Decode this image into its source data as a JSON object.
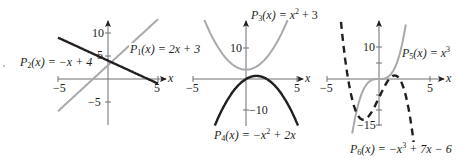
{
  "chart_data": [
    {
      "type": "line",
      "panel": 1,
      "title": "",
      "xlabel": "x",
      "ylabel": "",
      "xlim": [
        -5,
        5.8
      ],
      "ylim": [
        -10,
        13
      ],
      "x_ticks": [
        -5,
        5
      ],
      "x_tick_labels": [
        "-5",
        "5"
      ],
      "y_ticks": [
        -5,
        5,
        10
      ],
      "y_tick_labels": [
        "-5",
        "5",
        "10"
      ],
      "grid": false,
      "series": [
        {
          "name": "P1(x) = 2x + 3",
          "label_text": "P₁(x) = 2x + 3",
          "expr": "2x+3",
          "color": "#a7a9ac",
          "style": "solid",
          "x": [
            -5,
            -4,
            -3,
            -2,
            -1,
            0,
            1,
            2,
            3,
            4,
            5
          ],
          "values": [
            -7,
            -5,
            -3,
            -1,
            1,
            3,
            5,
            7,
            9,
            11,
            13
          ]
        },
        {
          "name": "P2(x) = -x + 4",
          "label_text": "P₂(x) = −x + 4",
          "expr": "-x+4",
          "color": "#231f20",
          "style": "solid",
          "x": [
            -5,
            -4,
            -3,
            -2,
            -1,
            0,
            1,
            2,
            3,
            4,
            5
          ],
          "values": [
            9,
            8,
            7,
            6,
            5,
            4,
            3,
            2,
            1,
            0,
            -1
          ]
        }
      ]
    },
    {
      "type": "line",
      "panel": 2,
      "title": "",
      "xlabel": "x",
      "ylabel": "",
      "xlim": [
        -5,
        5.8
      ],
      "ylim": [
        -15,
        19
      ],
      "x_ticks": [
        -5,
        5
      ],
      "x_tick_labels": [
        "-5",
        "5"
      ],
      "y_ticks": [
        -10,
        10
      ],
      "y_tick_labels": [
        "-10",
        "10"
      ],
      "grid": false,
      "series": [
        {
          "name": "P3(x) = x^2 + 3",
          "label_text": "P₃(x) = x² + 3",
          "expr": "x^2+3",
          "color": "#a7a9ac",
          "style": "solid",
          "x": [
            -4,
            -3,
            -2,
            -1,
            0,
            1,
            2,
            3,
            4
          ],
          "values": [
            19,
            12,
            7,
            4,
            3,
            4,
            7,
            12,
            19
          ]
        },
        {
          "name": "P4(x) = -x^2 + 2x",
          "label_text": "P₄(x) = −x² + 2x",
          "expr": "-x^2+2x",
          "color": "#231f20",
          "style": "solid",
          "x": [
            -3,
            -2,
            -1,
            0,
            1,
            2,
            3,
            4,
            5
          ],
          "values": [
            -15,
            -8,
            -3,
            0,
            1,
            0,
            -3,
            -8,
            -15
          ]
        }
      ]
    },
    {
      "type": "line",
      "panel": 3,
      "title": "",
      "xlabel": "x",
      "ylabel": "",
      "xlim": [
        -5,
        5.8
      ],
      "ylim": [
        -17,
        19
      ],
      "x_ticks": [
        -5,
        5
      ],
      "x_tick_labels": [
        "-5",
        "5"
      ],
      "y_ticks": [
        -15,
        -10,
        -5,
        5,
        10
      ],
      "y_tick_labels": [
        "-15",
        "",
        "",
        "",
        "10"
      ],
      "grid": false,
      "series": [
        {
          "name": "P5(x) = x^3",
          "label_text": "P₅(x) = x³",
          "expr": "x^3",
          "color": "#a7a9ac",
          "style": "solid",
          "x": [
            -2.6,
            -2,
            -1,
            0,
            1,
            2,
            2.6
          ],
          "values": [
            -17.6,
            -8,
            -1,
            0,
            1,
            8,
            17.6
          ]
        },
        {
          "name": "P6(x) = -x^3 + 7x - 6",
          "label_text": "P₆(x) = −x³ + 7x − 6",
          "expr": "-x^3+7x-6",
          "color": "#231f20",
          "style": "dashed",
          "x": [
            -3.8,
            -3,
            -2,
            -1.53,
            -1,
            0,
            1,
            1.53,
            2,
            3,
            3.9
          ],
          "values": [
            13.3,
            0,
            -12,
            -13.1,
            -12,
            -6,
            0,
            1.13,
            0,
            -12,
            -38
          ]
        }
      ]
    }
  ],
  "labels": {
    "p1": {
      "name": "P",
      "sub": "1",
      "arg": "(x) = 2x + 3"
    },
    "p2": {
      "name": "P",
      "sub": "2",
      "arg": "(x) = −x + 4"
    },
    "p3": {
      "name": "P",
      "sub": "3",
      "arg": "(x) = x",
      "sup": "2",
      "tail": " + 3"
    },
    "p4": {
      "name": "P",
      "sub": "4",
      "arg": "(x) = −x",
      "sup": "2",
      "tail": " + 2x"
    },
    "p5": {
      "name": "P",
      "sub": "5",
      "arg": "(x) = x",
      "sup": "3",
      "tail": ""
    },
    "p6": {
      "name": "P",
      "sub": "6",
      "arg": "(x) = −x",
      "sup": "3",
      "tail": " + 7x − 6"
    }
  },
  "axes": {
    "x_label": "x",
    "panel1": {
      "neg5": "−5",
      "pos5": "5",
      "y10": "10",
      "y5": "5",
      "yneg5": "−5"
    },
    "panel2": {
      "neg5": "−5",
      "pos5": "5",
      "y10": "10",
      "yneg10": "−10"
    },
    "panel3": {
      "neg5": "−5",
      "pos5": "5",
      "y10": "10",
      "yneg15": "−15"
    }
  }
}
